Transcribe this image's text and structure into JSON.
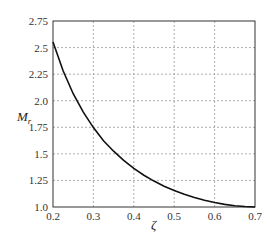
{
  "chart_data": {
    "type": "line",
    "title": "",
    "xlabel": "ζ",
    "ylabel": "M",
    "ylabel_sub": "r",
    "xlim": [
      0.2,
      0.7
    ],
    "ylim": [
      1.0,
      2.75
    ],
    "grid": true,
    "grid_style": "dashed",
    "legend": null,
    "x_ticks": [
      "0.2",
      "0.3",
      "0.4",
      "0.5",
      "0.6",
      "0.7"
    ],
    "y_ticks": [
      "1.0",
      "1.25",
      "1.5",
      "1.75",
      "2.0",
      "2.25",
      "2.5",
      "2.75"
    ],
    "series": [
      {
        "name": "Mr vs ζ",
        "color": "#111111",
        "x": [
          0.2,
          0.225,
          0.25,
          0.275,
          0.3,
          0.325,
          0.35,
          0.375,
          0.4,
          0.425,
          0.45,
          0.475,
          0.5,
          0.525,
          0.55,
          0.575,
          0.6,
          0.625,
          0.65,
          0.675,
          0.7
        ],
        "y": [
          2.552,
          2.282,
          2.066,
          1.892,
          1.747,
          1.624,
          1.525,
          1.438,
          1.364,
          1.299,
          1.244,
          1.196,
          1.155,
          1.119,
          1.089,
          1.063,
          1.042,
          1.025,
          1.012,
          1.004,
          1.0
        ]
      }
    ]
  }
}
